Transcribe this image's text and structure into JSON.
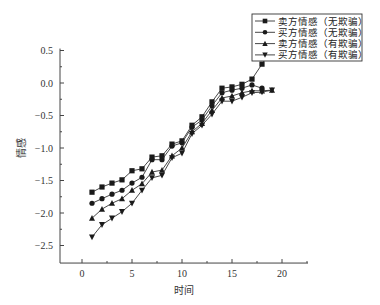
{
  "chart_data": {
    "type": "line",
    "title": "",
    "xlabel": "时间",
    "ylabel": "情感",
    "xlim": [
      -2.2,
      22.6
    ],
    "ylim": [
      -2.77,
      0.53
    ],
    "xticks": [
      0,
      5,
      10,
      15,
      20
    ],
    "yticks": [
      0.5,
      0.0,
      -0.5,
      -1.0,
      -1.5,
      -2.0,
      -2.5
    ],
    "ytick_labels": [
      "0.5",
      "0.0",
      "-0.5",
      "-1.0",
      "-1.5",
      "-2.0",
      "-2.5"
    ],
    "xtick_labels": [
      "0",
      "5",
      "10",
      "15",
      "20"
    ],
    "grid": false,
    "legend_position": "top-right",
    "series": [
      {
        "name": "卖方情感（无欺骗）",
        "marker": "square",
        "x": [
          1,
          2,
          3,
          4,
          5,
          6,
          7,
          8,
          9,
          10,
          11,
          12,
          13,
          14,
          15,
          16,
          17,
          18,
          19
        ],
        "values": [
          -1.68,
          -1.6,
          -1.54,
          -1.49,
          -1.35,
          -1.32,
          -1.14,
          -1.12,
          -0.94,
          -0.89,
          -0.65,
          -0.52,
          -0.29,
          -0.08,
          -0.06,
          -0.02,
          0.06,
          0.29,
          0.52
        ]
      },
      {
        "name": "买方情感（无欺骗）",
        "marker": "circle",
        "x": [
          1,
          2,
          3,
          4,
          5,
          6,
          7,
          8,
          9,
          10,
          11,
          12,
          13,
          14,
          15,
          16,
          17,
          18
        ],
        "values": [
          -1.85,
          -1.78,
          -1.71,
          -1.65,
          -1.54,
          -1.45,
          -1.18,
          -1.18,
          -0.97,
          -0.92,
          -0.68,
          -0.57,
          -0.35,
          -0.15,
          -0.11,
          -0.08,
          -0.03,
          -0.08
        ]
      },
      {
        "name": "卖方情感（有欺骗）",
        "marker": "triangle-up",
        "x": [
          1,
          2,
          3,
          4,
          5,
          6,
          7,
          8,
          9,
          10,
          11,
          12,
          13,
          14,
          15,
          16,
          17,
          18,
          19
        ],
        "values": [
          -2.08,
          -1.94,
          -1.85,
          -1.78,
          -1.65,
          -1.55,
          -1.37,
          -1.34,
          -1.12,
          -1.0,
          -0.75,
          -0.62,
          -0.42,
          -0.23,
          -0.2,
          -0.15,
          -0.12,
          -0.12,
          -0.11
        ]
      },
      {
        "name": "买方情感（有欺骗）",
        "marker": "triangle-down",
        "x": [
          1,
          2,
          3,
          4,
          5,
          6,
          7,
          8,
          9,
          10,
          11,
          12,
          13,
          14,
          15,
          16,
          17,
          18,
          19
        ],
        "values": [
          -2.37,
          -2.18,
          -2.08,
          -1.98,
          -1.85,
          -1.65,
          -1.46,
          -1.42,
          -1.15,
          -1.08,
          -0.78,
          -0.65,
          -0.48,
          -0.28,
          -0.28,
          -0.22,
          -0.15,
          -0.14,
          -0.11
        ]
      }
    ],
    "colors": {
      "line": "#333333",
      "marker": "#1a1a1a",
      "axis": "#444444"
    }
  }
}
